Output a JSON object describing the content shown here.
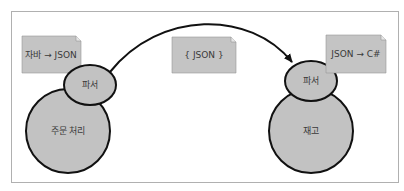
{
  "diagram": {
    "left_service": {
      "label": "주문 처리",
      "parser_label": "파서",
      "note": "자바 → JSON"
    },
    "right_service": {
      "label": "재고",
      "parser_label": "파서",
      "note": "JSON → C#"
    },
    "message": {
      "note": "{ JSON }"
    },
    "colors": {
      "fill": "#c2c2c2",
      "note_fill": "#c4c4c4",
      "stroke": "#111111",
      "frame": "#b0b0b0"
    }
  }
}
